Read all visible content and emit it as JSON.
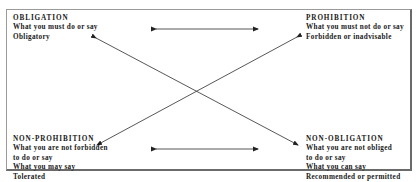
{
  "diagram": {
    "type": "deontic-square",
    "corners": {
      "top_left": {
        "title": "OBLIGATION",
        "lines": [
          "What you must do or say",
          "Obligatory"
        ]
      },
      "top_right": {
        "title": "PROHIBITION",
        "lines": [
          "What you must not do or say",
          "Forbidden or inadvisable"
        ]
      },
      "bottom_left": {
        "title": "NON-PROHIBITION",
        "lines": [
          "What you are not forbidden",
          "to do or say",
          "What you may say",
          "Tolerated"
        ]
      },
      "bottom_right": {
        "title": "NON-OBLIGATION",
        "lines": [
          "What you are not obliged",
          "to do or say",
          "What you can say",
          "Recommended or permitted"
        ]
      }
    },
    "relations": [
      {
        "from": "OBLIGATION",
        "to": "PROHIBITION",
        "kind": "double-arrow",
        "position": "top"
      },
      {
        "from": "NON-PROHIBITION",
        "to": "NON-OBLIGATION",
        "kind": "double-arrow",
        "position": "bottom"
      },
      {
        "from": "OBLIGATION",
        "to": "NON-OBLIGATION",
        "kind": "double-arrow",
        "position": "diagonal"
      },
      {
        "from": "PROHIBITION",
        "to": "NON-PROHIBITION",
        "kind": "double-arrow",
        "position": "diagonal"
      }
    ],
    "colors": {
      "text": "#1a1a1a",
      "arrow": "#333333",
      "border": "#6a6a6a",
      "background": "#ffffff"
    }
  }
}
